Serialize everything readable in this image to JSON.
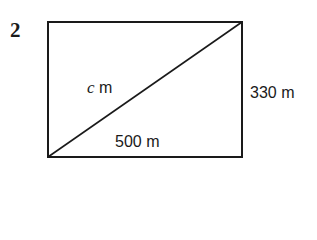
{
  "question_number": "2",
  "diagram": {
    "shape": "rectangle with diagonal",
    "diagonal_label": {
      "variable": "c",
      "unit": "m"
    },
    "height_label": "330 m",
    "width_label": "500 m",
    "stroke_color": "#1a1a1a"
  }
}
